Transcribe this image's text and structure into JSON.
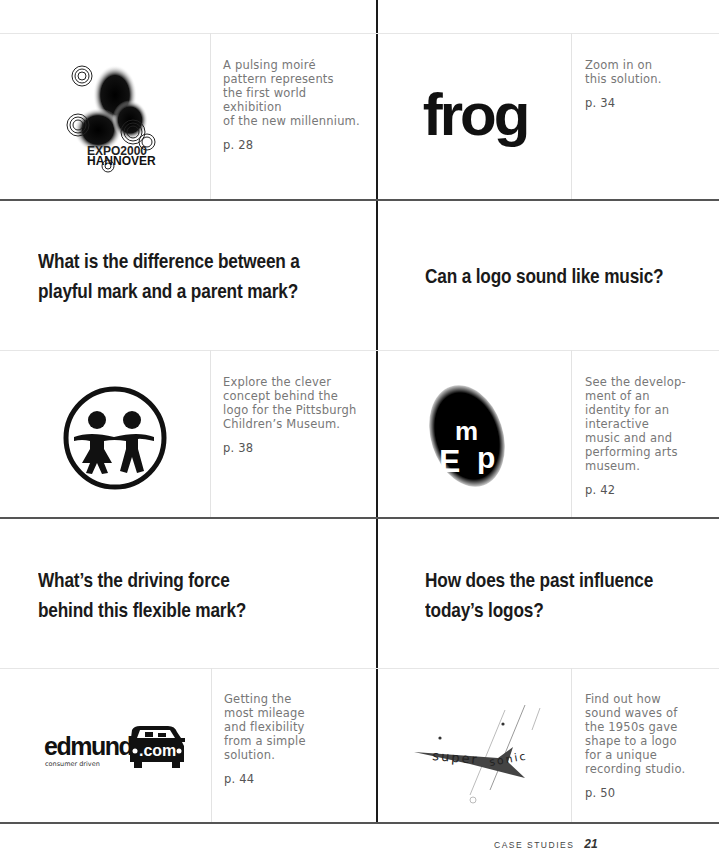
{
  "page": {
    "section_label": "CASE STUDIES",
    "page_number": "21"
  },
  "cases": [
    {
      "logo": "expo-2000-hannover-logo",
      "logo_text": [
        "EXPO2000",
        "HANNOVER"
      ],
      "description": "A pulsing moiré pattern represents the first world exhibition of the new millennium.",
      "description_lines": [
        "A pulsing moiré",
        "pattern represents",
        "the first world exhibition",
        "of the new millennium."
      ],
      "page_ref": "p. 28"
    },
    {
      "logo": "frog-logo",
      "logo_text": [
        "frog"
      ],
      "description_lines": [
        "Zoom in on",
        "this solution."
      ],
      "page_ref": "p. 34"
    },
    {
      "logo": "pittsburgh-childrens-museum-logo",
      "description_lines": [
        "Explore the clever",
        "concept behind the",
        "logo for the Pittsburgh",
        "Children’s Museum."
      ],
      "page_ref": "p. 38"
    },
    {
      "logo": "emp-logo",
      "logo_text": [
        "E",
        "m",
        "p"
      ],
      "description_lines": [
        "See the develop-",
        "ment of an",
        "identity for an",
        "interactive",
        "music and and",
        "performing arts",
        "museum."
      ],
      "page_ref": "p. 42"
    },
    {
      "logo": "edmunds-com-logo",
      "logo_text": [
        "edmunds",
        ".com",
        "consumer driven"
      ],
      "description_lines": [
        "Getting the",
        "most mileage",
        "and flexibility",
        "from a simple",
        "solution."
      ],
      "page_ref": "p. 44"
    },
    {
      "logo": "supersonic-logo",
      "logo_text": [
        "super",
        "sonic"
      ],
      "description_lines": [
        "Find out how",
        "sound waves of",
        "the 1950s gave",
        "shape to a logo",
        "for a unique",
        "recording studio."
      ],
      "page_ref": "p. 50"
    }
  ],
  "questions": [
    {
      "lines": [
        "What is the difference between a",
        "playful mark and a parent mark?"
      ]
    },
    {
      "lines": [
        "Can a logo sound like music?"
      ]
    },
    {
      "lines": [
        "What’s the driving force",
        "behind this flexible mark?"
      ]
    },
    {
      "lines": [
        "How does the past influence",
        "today’s logos?"
      ]
    }
  ],
  "colors": {
    "text_dark": "#1a1a1a",
    "text_gray": "#777777",
    "rule_dark": "#555555",
    "rule_light": "#e6e6e6"
  }
}
